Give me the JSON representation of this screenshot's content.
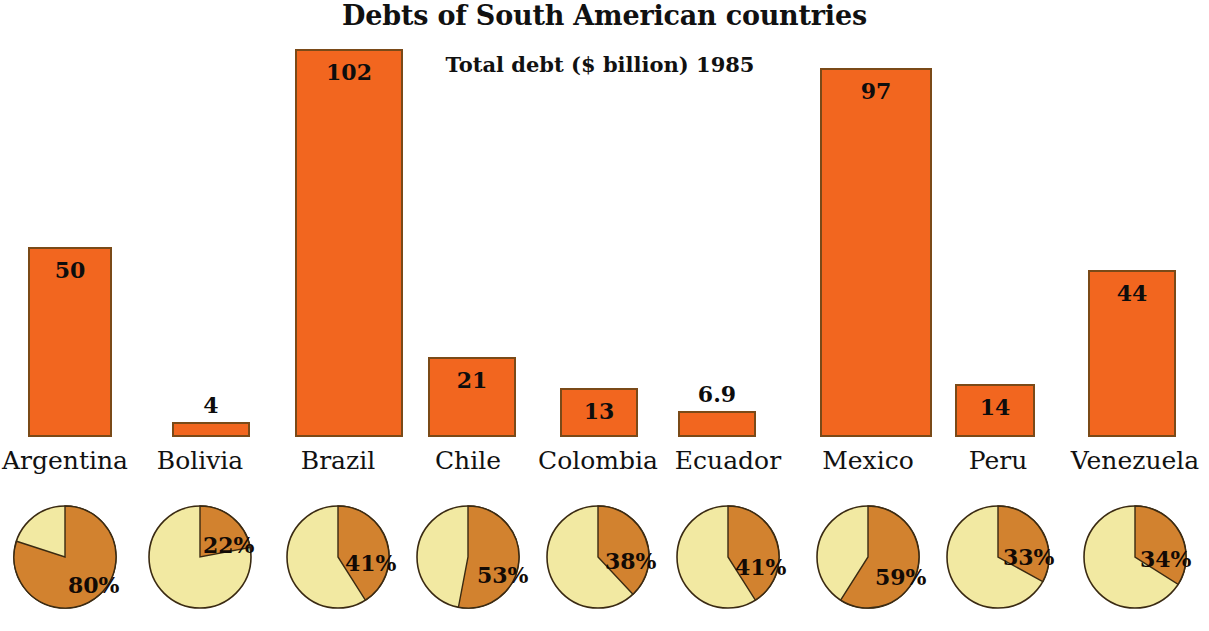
{
  "chart_data": {
    "type": "bar",
    "title": "Debts of South American countries",
    "subtitle": "Total debt ($ billion) 1985",
    "xlabel": "",
    "ylabel": "Total debt ($ billion)",
    "grid": false,
    "legend": "none",
    "ylim": [
      0,
      110
    ],
    "categories": [
      "Argentina",
      "Bolivia",
      "Brazil",
      "Chile",
      "Colombia",
      "Ecuador",
      "Mexico",
      "Peru",
      "Venezuela"
    ],
    "values": [
      50,
      4,
      102,
      21,
      13,
      6.9,
      97,
      14,
      44
    ],
    "value_labels": [
      "50",
      "4",
      "102",
      "21",
      "13",
      "6.9",
      "97",
      "14",
      "44"
    ],
    "series": [
      {
        "name": "Total debt ($ billion) 1985",
        "values": [
          50,
          4,
          102,
          21,
          13,
          6.9,
          97,
          14,
          44
        ]
      },
      {
        "name": "Share of debt (%) - pie charts",
        "type": "pie",
        "values": [
          80,
          22,
          41,
          53,
          38,
          41,
          59,
          33,
          34
        ],
        "labels": [
          "80%",
          "22%",
          "41%",
          "53%",
          "38%",
          "41%",
          "59%",
          "33%",
          "34%"
        ]
      }
    ],
    "colors": {
      "bar_fill": "#f2661f",
      "bar_stroke": "#7a4a18",
      "pie_dark": "#d2822f",
      "pie_light": "#f2e9a2",
      "pie_stroke": "#3a2a12",
      "text": "#111111",
      "background": "#ffffff"
    }
  },
  "columns": [
    {
      "country": "Argentina",
      "value": 50,
      "value_label": "50",
      "label_inside": true,
      "pct": 80,
      "pct_label": "80%",
      "pct_label_x": 56,
      "pct_label_y": 70
    },
    {
      "country": "Bolivia",
      "value": 4,
      "value_label": "4",
      "label_inside": false,
      "pct": 22,
      "pct_label": "22%",
      "pct_label_x": 56,
      "pct_label_y": 30
    },
    {
      "country": "Brazil",
      "value": 102,
      "value_label": "102",
      "label_inside": true,
      "pct": 41,
      "pct_label": "41%",
      "pct_label_x": 60,
      "pct_label_y": 48
    },
    {
      "country": "Chile",
      "value": 21,
      "value_label": "21",
      "label_inside": true,
      "pct": 53,
      "pct_label": "53%",
      "pct_label_x": 62,
      "pct_label_y": 60
    },
    {
      "country": "Colombia",
      "value": 13,
      "value_label": "13",
      "label_inside": true,
      "pct": 38,
      "pct_label": "38%",
      "pct_label_x": 60,
      "pct_label_y": 46
    },
    {
      "country": "Ecuador",
      "value": 6.9,
      "value_label": "6.9",
      "label_inside": false,
      "pct": 41,
      "pct_label": "41%",
      "pct_label_x": 60,
      "pct_label_y": 52
    },
    {
      "country": "Mexico",
      "value": 97,
      "value_label": "97",
      "label_inside": true,
      "pct": 59,
      "pct_label": "59%",
      "pct_label_x": 60,
      "pct_label_y": 62
    },
    {
      "country": "Peru",
      "value": 14,
      "value_label": "14",
      "label_inside": true,
      "pct": 33,
      "pct_label": "33%",
      "pct_label_x": 58,
      "pct_label_y": 42
    },
    {
      "country": "Venezuela",
      "value": 44,
      "value_label": "44",
      "label_inside": true,
      "pct": 34,
      "pct_label": "34%",
      "pct_label_x": 58,
      "pct_label_y": 44
    }
  ],
  "layout": {
    "baseline_y": 437,
    "px_per_unit": 3.8,
    "pie_radius": 51,
    "pie_center_y": 557,
    "columns_x": [
      28,
      172,
      295,
      428,
      560,
      678,
      820,
      955,
      1088
    ],
    "bar_widths": [
      84,
      78,
      108,
      88,
      78,
      78,
      112,
      80,
      88
    ],
    "pie_centers_x": [
      65,
      200,
      338,
      468,
      598,
      728,
      868,
      998,
      1135
    ]
  }
}
